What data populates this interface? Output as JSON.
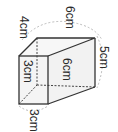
{
  "diagram": {
    "type": "3d-box-with-dimensions",
    "labels": {
      "top_left_edge": "4cm",
      "top_back_edge": "6cm",
      "right_back_edge": "5cm",
      "front_face_height": "3cm",
      "side_face_length": "6cm",
      "front_bottom_width": "3cm"
    },
    "colors": {
      "edge": "#333333",
      "hidden_edge": "#444444",
      "arc": "#aaaaaa",
      "face_fill": "#f2f2f2"
    }
  }
}
